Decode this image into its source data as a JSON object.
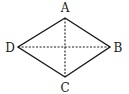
{
  "diagram": {
    "type": "rhombus-with-diagonals",
    "vertices": {
      "A": {
        "label": "A",
        "x": 65,
        "y": 18
      },
      "B": {
        "label": "B",
        "x": 110,
        "y": 47
      },
      "C": {
        "label": "C",
        "x": 65,
        "y": 77
      },
      "D": {
        "label": "D",
        "x": 18,
        "y": 47
      }
    },
    "edges": [
      "AB",
      "BC",
      "CD",
      "DA"
    ],
    "diagonals": {
      "AC": "dashed",
      "DB": "dashed"
    },
    "labels": {
      "a": "A",
      "b": "B",
      "c": "C",
      "d": "D"
    },
    "colors": {
      "stroke": "#1a1a1a",
      "background": "#ffffff"
    }
  }
}
